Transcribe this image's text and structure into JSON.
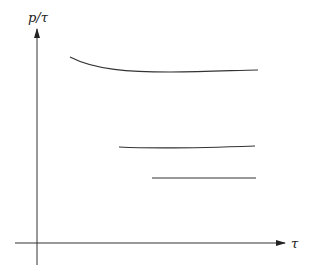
{
  "diagram": {
    "y_axis_label": "p/τ",
    "x_axis_label": "τ",
    "curves": [
      {
        "name": "upper-curve",
        "path": "M70,57 C95,70 130,72 170,72 C210,72 240,70 258,70"
      },
      {
        "name": "middle-curve",
        "path": "M119,147 C160,149 200,148 255,146"
      },
      {
        "name": "lower-curve",
        "path": "M152,178 L256,178"
      }
    ],
    "colors": {
      "line": "#333333",
      "axis": "#222222"
    }
  }
}
